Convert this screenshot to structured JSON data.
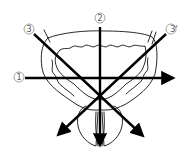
{
  "diagram": {
    "type": "anatomical-direction-diagram",
    "labels": {
      "axis1": "①",
      "axis2": "②",
      "axis3": "③",
      "axis3prime": "③'"
    },
    "axes": [
      {
        "id": "axis1",
        "label": "①",
        "direction": "horizontal, left to right",
        "from": [
          25,
          78
        ],
        "to": [
          176,
          78
        ]
      },
      {
        "id": "axis2",
        "label": "②",
        "direction": "vertical, top to bottom",
        "from": [
          100,
          27
        ],
        "to": [
          100,
          148
        ]
      },
      {
        "id": "axis3",
        "label": "③",
        "direction": "diagonal, upper-left to lower-right",
        "from": [
          34,
          34
        ],
        "to": [
          146,
          139
        ]
      },
      {
        "id": "axis3prime",
        "label": "③'",
        "direction": "diagonal, upper-right to lower-left",
        "from": [
          166,
          34
        ],
        "to": [
          55,
          138
        ]
      }
    ],
    "intersection": [
      100,
      97
    ],
    "colors": {
      "line": "#000000",
      "label": "#555555",
      "background": "#ffffff"
    }
  }
}
